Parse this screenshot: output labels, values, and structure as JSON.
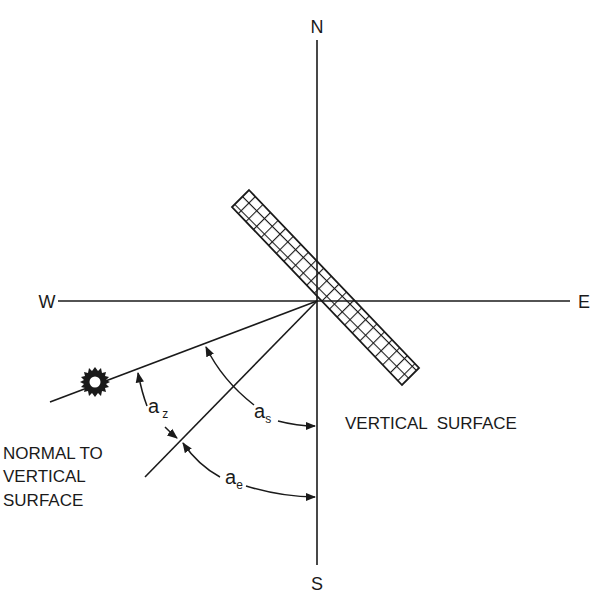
{
  "diagram": {
    "compass": {
      "north": "N",
      "south": "S",
      "west": "W",
      "east": "E"
    },
    "labels": {
      "vertical_surface": "VERTICAL  SURFACE",
      "normal_line1": "NORMAL TO",
      "normal_line2": "VERTICAL",
      "normal_line3": "SURFACE"
    },
    "angles": {
      "a_z": {
        "main": "a",
        "sub": "z",
        "meaning": "angle between sun direction and surface normal"
      },
      "a_s": {
        "main": "a",
        "sub": "s",
        "meaning": "solar azimuth from south"
      },
      "a_e": {
        "main": "a",
        "sub": "e",
        "meaning": "surface azimuth from south"
      }
    },
    "elements": {
      "sun_icon": "sun",
      "surface_fill": "crosshatch"
    },
    "colors": {
      "ink": "#1a1a1a",
      "background": "#ffffff"
    }
  }
}
